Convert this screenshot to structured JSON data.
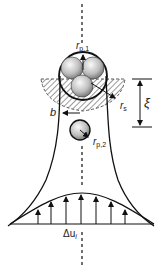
{
  "diagram": {
    "labels": {
      "r_p1": "r",
      "r_p1_sub": "p,1",
      "r_s": "r",
      "r_s_sub": "s",
      "xi": "ξ",
      "b": "b",
      "r_p2": "r",
      "r_p2_sub": "p,2",
      "delta_u": "Δu",
      "delta_u_sub": "i"
    },
    "colors": {
      "stroke": "#111111",
      "hatch": "#555555",
      "sphere_light": "#f2f2f2",
      "sphere_dark": "#7a7a7a"
    },
    "velocity_arrow_count": 7
  }
}
